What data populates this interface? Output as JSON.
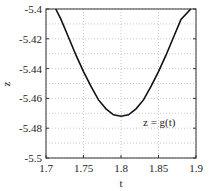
{
  "chart_data": {
    "type": "line",
    "title": "",
    "xlabel": "t",
    "ylabel": "z",
    "xlim": [
      1.7,
      1.9
    ],
    "ylim": [
      -5.5,
      -5.4
    ],
    "xticks": [
      "1.7",
      "1.75",
      "1.8",
      "1.85",
      "1.9"
    ],
    "yticks": [
      "-5.4",
      "-5.42",
      "-5.44",
      "-5.46",
      "-5.48",
      "-5.5"
    ],
    "grid": true,
    "grid_style": "dotted",
    "annotation": "z = g(t)",
    "series": [
      {
        "name": "z = g(t)",
        "color": "#111111",
        "x": [
          1.713,
          1.72,
          1.73,
          1.74,
          1.75,
          1.76,
          1.77,
          1.78,
          1.79,
          1.8,
          1.81,
          1.82,
          1.83,
          1.84,
          1.85,
          1.86,
          1.87,
          1.88,
          1.893
        ],
        "y": [
          -5.4,
          -5.407,
          -5.419,
          -5.431,
          -5.442,
          -5.452,
          -5.461,
          -5.467,
          -5.471,
          -5.472,
          -5.471,
          -5.467,
          -5.461,
          -5.452,
          -5.442,
          -5.431,
          -5.419,
          -5.407,
          -5.4
        ]
      }
    ]
  }
}
